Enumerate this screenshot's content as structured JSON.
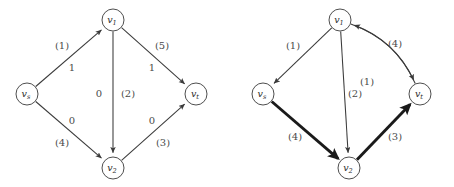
{
  "figure": {
    "panels": [
      {
        "id": "left-panel",
        "name": "original-network-graph",
        "nodes": [
          {
            "id": "v1",
            "label_base": "v",
            "label_sub": "1",
            "x": 113,
            "y": 20,
            "r": 11
          },
          {
            "id": "vs",
            "label_base": "v",
            "label_sub": "s",
            "x": 27,
            "y": 94,
            "r": 11
          },
          {
            "id": "vt",
            "label_base": "v",
            "label_sub": "t",
            "x": 196,
            "y": 94,
            "r": 11
          },
          {
            "id": "v2",
            "label_base": "v",
            "label_sub": "2",
            "x": 113,
            "y": 168,
            "r": 11
          }
        ],
        "edges": [
          {
            "id": "vs-v1",
            "from": "vs",
            "to": "v1",
            "weight": "thin",
            "flow": "1",
            "capacity": "(1)"
          },
          {
            "id": "v1-vt",
            "from": "v1",
            "to": "vt",
            "weight": "thin",
            "flow": "1",
            "capacity": "(5)"
          },
          {
            "id": "v1-v2",
            "from": "v1",
            "to": "v2",
            "weight": "thin",
            "flow": "0",
            "capacity": "(2)"
          },
          {
            "id": "vs-v2",
            "from": "vs",
            "to": "v2",
            "weight": "thin",
            "flow": "0",
            "capacity": "(4)"
          },
          {
            "id": "v2-vt",
            "from": "v2",
            "to": "vt",
            "weight": "thin",
            "flow": "0",
            "capacity": "(3)"
          }
        ],
        "labels": [
          {
            "id": "cap-vs-v1",
            "text": "(1)",
            "x": 62,
            "y": 46
          },
          {
            "id": "flow-vs-v1",
            "text": "1",
            "x": 72,
            "y": 68
          },
          {
            "id": "cap-v1-vt",
            "text": "(5)",
            "x": 162,
            "y": 46
          },
          {
            "id": "flow-v1-vt",
            "text": "1",
            "x": 152,
            "y": 68
          },
          {
            "id": "flow-v1-v2",
            "text": "0",
            "x": 99,
            "y": 94
          },
          {
            "id": "cap-v1-v2",
            "text": "(2)",
            "x": 128,
            "y": 94
          },
          {
            "id": "flow-vs-v2",
            "text": "0",
            "x": 72,
            "y": 121
          },
          {
            "id": "cap-vs-v2",
            "text": "(4)",
            "x": 62,
            "y": 143
          },
          {
            "id": "flow-v2-vt",
            "text": "0",
            "x": 152,
            "y": 121
          },
          {
            "id": "cap-v2-vt",
            "text": "(3)",
            "x": 163,
            "y": 143
          }
        ]
      },
      {
        "id": "right-panel",
        "name": "residual-network-graph",
        "nodes": [
          {
            "id": "v1",
            "label_base": "v",
            "label_sub": "1",
            "x": 113,
            "y": 20,
            "r": 11
          },
          {
            "id": "vs",
            "label_base": "v",
            "label_sub": "s",
            "x": 36,
            "y": 94,
            "r": 11
          },
          {
            "id": "vt",
            "label_base": "v",
            "label_sub": "t",
            "x": 193,
            "y": 94,
            "r": 11
          },
          {
            "id": "v2",
            "label_base": "v",
            "label_sub": "2",
            "x": 122,
            "y": 168,
            "r": 11
          }
        ],
        "edges": [
          {
            "id": "v1-vs",
            "from": "v1",
            "to": "vs",
            "weight": "thin",
            "capacity": "(1)",
            "curve": "none"
          },
          {
            "id": "v1-v2",
            "from": "v1",
            "to": "v2",
            "weight": "thin",
            "capacity": "(2)",
            "curve": "none"
          },
          {
            "id": "vt-v1",
            "from": "vt",
            "to": "v1",
            "weight": "thin",
            "capacity": "(1)",
            "curve": "inner"
          },
          {
            "id": "v1-vt",
            "from": "v1",
            "to": "vt",
            "weight": "thin",
            "capacity": "(4)",
            "curve": "outer"
          },
          {
            "id": "vs-v2",
            "from": "vs",
            "to": "v2",
            "weight": "thick",
            "capacity": "(4)",
            "curve": "none"
          },
          {
            "id": "v2-vt",
            "from": "v2",
            "to": "vt",
            "weight": "thick",
            "capacity": "(3)",
            "curve": "none"
          }
        ],
        "labels": [
          {
            "id": "cap-v1-vs",
            "text": "(1)",
            "x": 66,
            "y": 46
          },
          {
            "id": "cap-v1-vt",
            "text": "(4)",
            "x": 168,
            "y": 44
          },
          {
            "id": "cap-vt-v1",
            "text": "(1)",
            "x": 140,
            "y": 82
          },
          {
            "id": "cap-v1-v2",
            "text": "(2)",
            "x": 128,
            "y": 94
          },
          {
            "id": "cap-vs-v2",
            "text": "(4)",
            "x": 68,
            "y": 137
          },
          {
            "id": "cap-v2-vt",
            "text": "(3)",
            "x": 168,
            "y": 137
          }
        ]
      }
    ],
    "colors": {
      "background": "#ffffff",
      "node_stroke": "#3a3a3a",
      "edge_thin": "#3a3a3a",
      "edge_thick": "#1a1a1a",
      "label_text": "#4a4a4a",
      "node_text": "#2b2b2b"
    }
  },
  "chart_data": {
    "type": "diagram",
    "title": "",
    "left_graph": {
      "nodes": [
        "v_s",
        "v_1",
        "v_2",
        "v_t"
      ],
      "edges": [
        {
          "from": "v_s",
          "to": "v_1",
          "flow": 1,
          "capacity": 1
        },
        {
          "from": "v_1",
          "to": "v_t",
          "flow": 1,
          "capacity": 5
        },
        {
          "from": "v_1",
          "to": "v_2",
          "flow": 0,
          "capacity": 2
        },
        {
          "from": "v_s",
          "to": "v_2",
          "flow": 0,
          "capacity": 4
        },
        {
          "from": "v_2",
          "to": "v_t",
          "flow": 0,
          "capacity": 3
        }
      ]
    },
    "right_graph": {
      "nodes": [
        "v_s",
        "v_1",
        "v_2",
        "v_t"
      ],
      "edges": [
        {
          "from": "v_1",
          "to": "v_s",
          "residual": 1,
          "bold": false
        },
        {
          "from": "v_1",
          "to": "v_2",
          "residual": 2,
          "bold": false
        },
        {
          "from": "v_t",
          "to": "v_1",
          "residual": 1,
          "bold": false
        },
        {
          "from": "v_1",
          "to": "v_t",
          "residual": 4,
          "bold": false
        },
        {
          "from": "v_s",
          "to": "v_2",
          "residual": 4,
          "bold": true
        },
        {
          "from": "v_2",
          "to": "v_t",
          "residual": 3,
          "bold": true
        }
      ]
    }
  }
}
